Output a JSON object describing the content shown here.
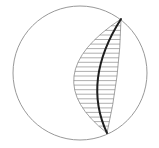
{
  "diagram": {
    "type": "stereonet-great-circle",
    "width": 159,
    "height": 148,
    "colors": {
      "background": "#ffffff",
      "primitive_circle": "#8c8c8c",
      "hatch": "#8c8c8c",
      "envelope": "#8c8c8c",
      "great_circle": "#1e1e1e"
    },
    "primitive_circle": {
      "cx": 80,
      "cy": 73,
      "r": 67,
      "stroke_width": 0.9
    },
    "endpoints": {
      "top": {
        "x": 121,
        "y": 19
      },
      "bottom": {
        "x": 107,
        "y": 133
      }
    },
    "envelope_left_arc": {
      "control": {
        "x": 34,
        "y": 76
      },
      "stroke_width": 0.8
    },
    "envelope_right_arc": {
      "control": {
        "x": 120,
        "y": 76
      },
      "stroke_width": 0.8
    },
    "great_circle_arc": {
      "control": {
        "x": 82,
        "y": 80
      },
      "stroke_width": 2
    },
    "hatch_lines": [
      {
        "x1": 111.1,
        "y1": 25.8,
        "x2": 120.8,
        "y2": 25.8
      },
      {
        "x1": 105.2,
        "y1": 30.4,
        "x2": 120.7,
        "y2": 30.4
      },
      {
        "x1": 99.8,
        "y1": 35.0,
        "x2": 120.5,
        "y2": 35.0
      },
      {
        "x1": 94.9,
        "y1": 39.5,
        "x2": 120.3,
        "y2": 39.5
      },
      {
        "x1": 90.5,
        "y1": 44.1,
        "x2": 120.0,
        "y2": 44.1
      },
      {
        "x1": 86.6,
        "y1": 48.6,
        "x2": 119.7,
        "y2": 48.6
      },
      {
        "x1": 83.2,
        "y1": 53.2,
        "x2": 119.3,
        "y2": 53.2
      },
      {
        "x1": 80.3,
        "y1": 57.8,
        "x2": 119.0,
        "y2": 57.8
      },
      {
        "x1": 78.0,
        "y1": 62.3,
        "x2": 118.5,
        "y2": 62.3
      },
      {
        "x1": 76.1,
        "y1": 66.9,
        "x2": 118.1,
        "y2": 66.9
      },
      {
        "x1": 74.8,
        "y1": 71.4,
        "x2": 117.5,
        "y2": 71.4
      },
      {
        "x1": 74.0,
        "y1": 76.0,
        "x2": 117.0,
        "y2": 76.0
      },
      {
        "x1": 73.7,
        "y1": 80.6,
        "x2": 116.4,
        "y2": 80.6
      },
      {
        "x1": 73.9,
        "y1": 85.1,
        "x2": 115.8,
        "y2": 85.1
      },
      {
        "x1": 74.6,
        "y1": 89.7,
        "x2": 115.1,
        "y2": 89.7
      },
      {
        "x1": 75.9,
        "y1": 94.2,
        "x2": 114.5,
        "y2": 94.2
      },
      {
        "x1": 77.6,
        "y1": 98.8,
        "x2": 113.7,
        "y2": 98.8
      },
      {
        "x1": 79.9,
        "y1": 103.3,
        "x2": 113.0,
        "y2": 103.3
      },
      {
        "x1": 82.6,
        "y1": 107.9,
        "x2": 112.2,
        "y2": 107.9
      },
      {
        "x1": 85.9,
        "y1": 112.4,
        "x2": 111.2,
        "y2": 112.4
      },
      {
        "x1": 89.7,
        "y1": 117.1,
        "x2": 110.4,
        "y2": 117.1
      },
      {
        "x1": 94.0,
        "y1": 121.6,
        "x2": 109.5,
        "y2": 121.6
      },
      {
        "x1": 98.8,
        "y1": 126.1,
        "x2": 108.5,
        "y2": 126.1
      }
    ]
  }
}
